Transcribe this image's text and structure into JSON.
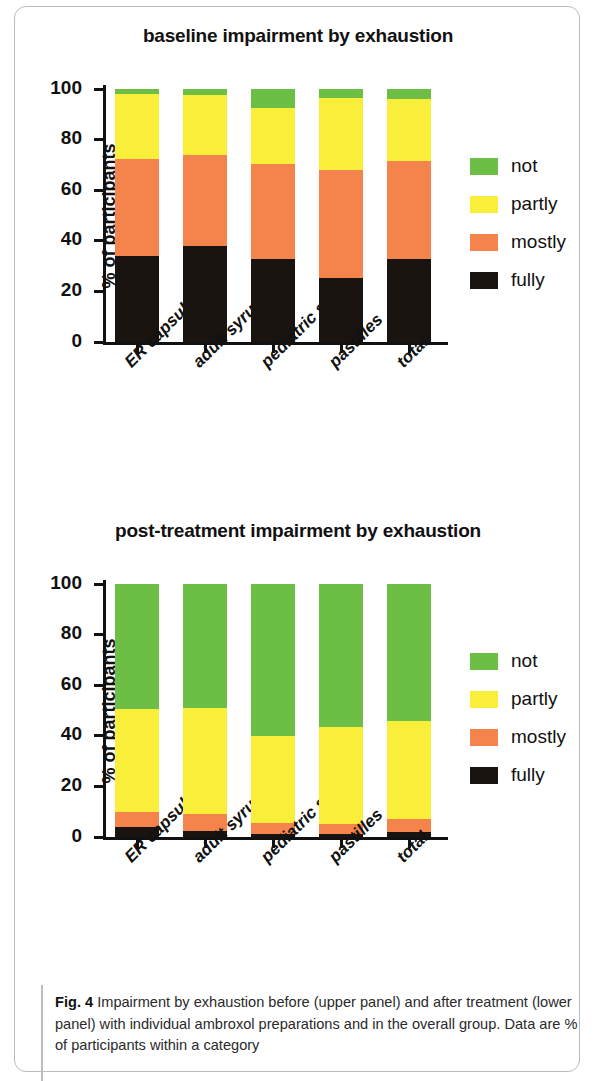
{
  "figure": {
    "caption_label": "Fig. 4",
    "caption_text": " Impairment by exhaustion before (upper panel) and after treatment (lower panel) with individual ambroxol preparations and in the overall group. Data are % of participants within a category"
  },
  "colors": {
    "not": "#6cbe45",
    "partly": "#f9ee3a",
    "mostly": "#f4844c",
    "fully": "#1a1410",
    "axis": "#111111",
    "card_border": "#b9bcc0"
  },
  "legend": {
    "items": [
      {
        "label": "not",
        "color": "#6cbe45"
      },
      {
        "label": "partly",
        "color": "#f9ee3a"
      },
      {
        "label": "mostly",
        "color": "#f4844c"
      },
      {
        "label": "fully",
        "color": "#1a1410"
      }
    ]
  },
  "chart_data": [
    {
      "type": "bar",
      "stacked": true,
      "panel": "upper",
      "title": "baseline impairment by exhaustion",
      "xlabel": "",
      "ylabel": "% of participants",
      "ylim": [
        0,
        100
      ],
      "yticks": [
        0,
        20,
        40,
        60,
        80,
        100
      ],
      "grid": false,
      "legend_position": "right",
      "categories": [
        "ER capsules",
        "adult syrup",
        "pediatric syrup",
        "pastilles",
        "total"
      ],
      "series": [
        {
          "name": "fully",
          "color": "#1a1410",
          "values": [
            34.0,
            38.0,
            33.0,
            25.5,
            33.0
          ]
        },
        {
          "name": "mostly",
          "color": "#f4844c",
          "values": [
            38.5,
            36.0,
            37.5,
            42.5,
            38.5
          ]
        },
        {
          "name": "partly",
          "color": "#f9ee3a",
          "values": [
            25.5,
            23.5,
            22.0,
            28.5,
            24.5
          ]
        },
        {
          "name": "not",
          "color": "#6cbe45",
          "values": [
            2.0,
            2.5,
            7.5,
            3.5,
            4.0
          ]
        }
      ]
    },
    {
      "type": "bar",
      "stacked": true,
      "panel": "lower",
      "title": "post-treatment impairment by exhaustion",
      "xlabel": "",
      "ylabel": "% of participants",
      "ylim": [
        0,
        100
      ],
      "yticks": [
        0,
        20,
        40,
        60,
        80,
        100
      ],
      "grid": false,
      "legend_position": "right",
      "categories": [
        "ER capsules",
        "adult syrup",
        "pediatric syrup",
        "pastilles",
        "total"
      ],
      "series": [
        {
          "name": "fully",
          "color": "#1a1410",
          "values": [
            4.0,
            2.5,
            1.0,
            1.0,
            2.0
          ]
        },
        {
          "name": "mostly",
          "color": "#f4844c",
          "values": [
            6.0,
            6.5,
            4.5,
            4.0,
            5.0
          ]
        },
        {
          "name": "partly",
          "color": "#f9ee3a",
          "values": [
            40.5,
            42.0,
            34.5,
            38.5,
            39.0
          ]
        },
        {
          "name": "not",
          "color": "#6cbe45",
          "values": [
            49.5,
            49.0,
            60.0,
            56.5,
            54.0
          ]
        }
      ]
    }
  ]
}
